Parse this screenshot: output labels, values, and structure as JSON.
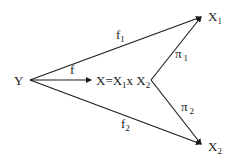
{
  "diagram": {
    "type": "commutative-diagram",
    "nodes": {
      "Y": {
        "label": "Y"
      },
      "X": {
        "label_main": "X=X",
        "sub1": "1",
        "mid": "x X",
        "sub2": "2"
      },
      "X1": {
        "label": "X",
        "sub": "1"
      },
      "X2": {
        "label": "X",
        "sub": "2"
      }
    },
    "arrows": {
      "f": {
        "label": "f",
        "from": "Y",
        "to": "X"
      },
      "f1": {
        "label": "f",
        "sub": "1",
        "from": "Y",
        "to": "X1"
      },
      "f2": {
        "label": "f",
        "sub": "2",
        "from": "Y",
        "to": "X2"
      },
      "pi1": {
        "label": "π",
        "sub": "1",
        "from": "X",
        "to": "X1"
      },
      "pi2": {
        "label": "π",
        "sub": "2",
        "from": "X",
        "to": "X2"
      }
    },
    "colors": {
      "line": "#1a1a1a",
      "background": "#ffffff"
    }
  }
}
